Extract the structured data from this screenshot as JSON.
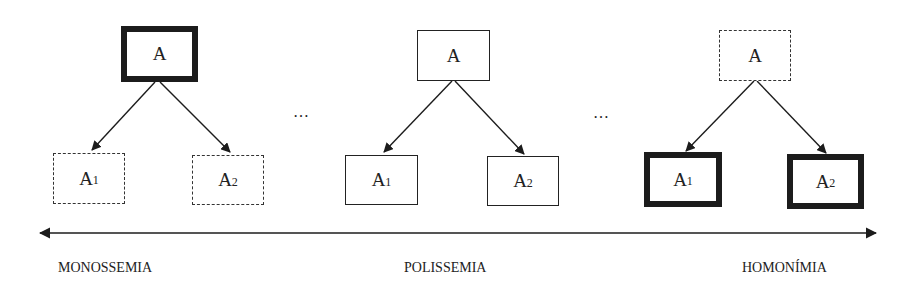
{
  "panels": [
    {
      "name": "monossemia",
      "parent": {
        "label": "A",
        "style": "thick"
      },
      "children": [
        {
          "label": "A",
          "sub": "1",
          "style": "dashed"
        },
        {
          "label": "A",
          "sub": "2",
          "style": "dashed"
        }
      ]
    },
    {
      "name": "polissemia",
      "parent": {
        "label": "A",
        "style": "solid"
      },
      "children": [
        {
          "label": "A",
          "sub": "1",
          "style": "solid"
        },
        {
          "label": "A",
          "sub": "2",
          "style": "solid"
        }
      ]
    },
    {
      "name": "homonimia",
      "parent": {
        "label": "A",
        "style": "dashed"
      },
      "children": [
        {
          "label": "A",
          "sub": "1",
          "style": "thick"
        },
        {
          "label": "A",
          "sub": "2",
          "style": "thick"
        }
      ]
    }
  ],
  "ellipsis": [
    "…",
    "…"
  ],
  "axis": {
    "labels": [
      "MONOSSEMIA",
      "POLISSEMIA",
      "HOMONÍMIA"
    ],
    "direction": "bidirectional"
  },
  "colors": {
    "ink": "#1c1c1c",
    "background": "#ffffff"
  }
}
